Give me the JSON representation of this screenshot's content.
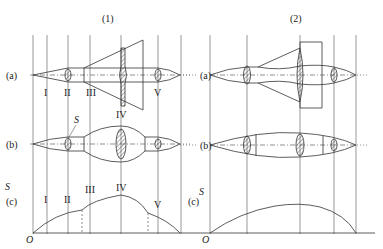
{
  "figure": {
    "panels": [
      {
        "label": "(1)",
        "rows": [
          "(a)",
          "(b)",
          "(c)"
        ],
        "stations": [
          "I",
          "II",
          "III",
          "IV",
          "V"
        ],
        "area_label": "S",
        "origin": "O"
      },
      {
        "label": "(2)",
        "rows": [
          "(a)",
          "(b)",
          "(c)"
        ],
        "area_label": "S",
        "origin": "O"
      }
    ],
    "annotations": {
      "section_area": "S"
    }
  }
}
